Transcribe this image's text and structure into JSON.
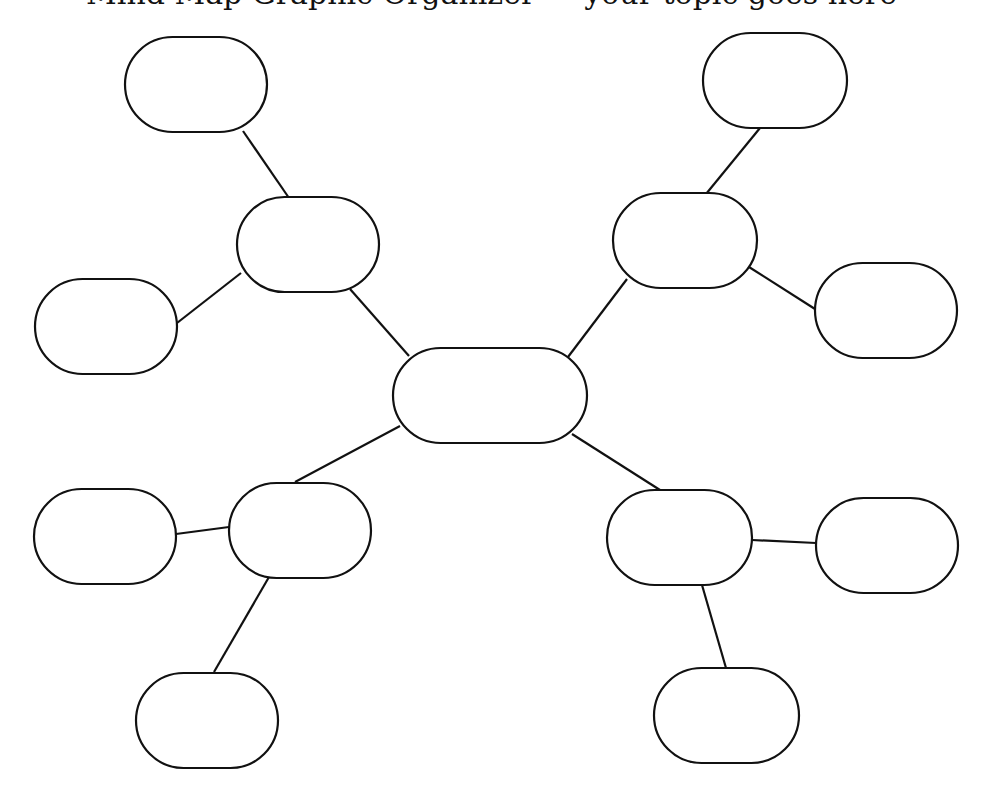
{
  "header": {
    "partial_title": "Mind Map Graphic Organizer — your topic goes here"
  },
  "colors": {
    "stroke": "#111111",
    "fill": "#ffffff",
    "background": "#ffffff"
  },
  "diagram": {
    "type": "mind-map",
    "nodes": [
      {
        "id": "center",
        "label": "",
        "x": 393,
        "y": 348,
        "w": 194,
        "h": 95
      },
      {
        "id": "ul-branch",
        "label": "",
        "x": 237,
        "y": 197,
        "w": 142,
        "h": 95
      },
      {
        "id": "ul-top",
        "label": "",
        "x": 125,
        "y": 37,
        "w": 142,
        "h": 95
      },
      {
        "id": "ul-left",
        "label": "",
        "x": 35,
        "y": 279,
        "w": 142,
        "h": 95
      },
      {
        "id": "ur-branch",
        "label": "",
        "x": 613,
        "y": 193,
        "w": 144,
        "h": 95
      },
      {
        "id": "ur-top",
        "label": "",
        "x": 703,
        "y": 33,
        "w": 144,
        "h": 95
      },
      {
        "id": "ur-right",
        "label": "",
        "x": 815,
        "y": 263,
        "w": 142,
        "h": 95
      },
      {
        "id": "ll-branch",
        "label": "",
        "x": 229,
        "y": 483,
        "w": 142,
        "h": 95
      },
      {
        "id": "ll-left",
        "label": "",
        "x": 34,
        "y": 489,
        "w": 142,
        "h": 95
      },
      {
        "id": "ll-bottom",
        "label": "",
        "x": 136,
        "y": 673,
        "w": 142,
        "h": 95
      },
      {
        "id": "lr-branch",
        "label": "",
        "x": 607,
        "y": 490,
        "w": 145,
        "h": 95
      },
      {
        "id": "lr-right",
        "label": "",
        "x": 816,
        "y": 498,
        "w": 142,
        "h": 95
      },
      {
        "id": "lr-bottom",
        "label": "",
        "x": 654,
        "y": 668,
        "w": 145,
        "h": 95
      }
    ],
    "edges": [
      {
        "x1": 409,
        "y1": 356,
        "x2": 350,
        "y2": 289
      },
      {
        "x1": 289,
        "y1": 198,
        "x2": 243,
        "y2": 131
      },
      {
        "x1": 241,
        "y1": 273,
        "x2": 177,
        "y2": 323
      },
      {
        "x1": 568,
        "y1": 357,
        "x2": 627,
        "y2": 279
      },
      {
        "x1": 706,
        "y1": 194,
        "x2": 760,
        "y2": 128
      },
      {
        "x1": 749,
        "y1": 267,
        "x2": 815,
        "y2": 309
      },
      {
        "x1": 400,
        "y1": 426,
        "x2": 295,
        "y2": 482
      },
      {
        "x1": 176,
        "y1": 534,
        "x2": 229,
        "y2": 527
      },
      {
        "x1": 269,
        "y1": 577,
        "x2": 214,
        "y2": 672
      },
      {
        "x1": 572,
        "y1": 434,
        "x2": 660,
        "y2": 490
      },
      {
        "x1": 752,
        "y1": 540,
        "x2": 816,
        "y2": 543
      },
      {
        "x1": 702,
        "y1": 585,
        "x2": 726,
        "y2": 668
      }
    ]
  }
}
